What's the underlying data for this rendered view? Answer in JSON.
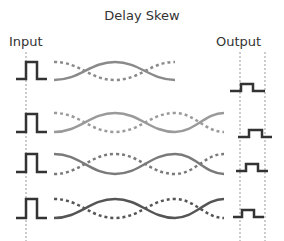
{
  "diagram": {
    "title": "Delay Skew",
    "input_label": "Input",
    "output_label": "Output",
    "colors": {
      "pulse": "#333333",
      "guide": "#999999",
      "rows": [
        "#8a8a8a",
        "#9a9a9a",
        "#7a7a7a",
        "#555555"
      ]
    },
    "rows": [
      {
        "name": "pair-1",
        "output_delay": "early"
      },
      {
        "name": "pair-2",
        "output_delay": "late"
      },
      {
        "name": "pair-3",
        "output_delay": "medium"
      },
      {
        "name": "pair-4",
        "output_delay": "early"
      }
    ]
  }
}
